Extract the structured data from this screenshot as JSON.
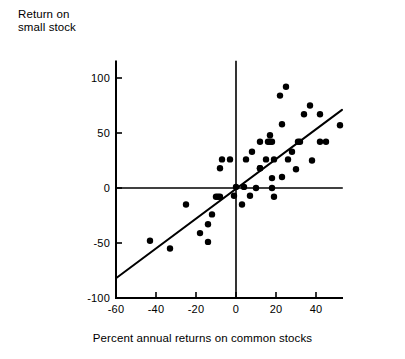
{
  "chart_data": {
    "type": "scatter",
    "title": "",
    "xlabel": "Percent annual returns on common stocks",
    "ylabel": "Return on small stock",
    "ylabel_lines": [
      "Return on",
      "small stock"
    ],
    "xlim": [
      -60,
      53
    ],
    "ylim": [
      -100,
      115
    ],
    "xticks": [
      -60,
      -40,
      -20,
      0,
      20,
      40
    ],
    "xtick_labels": [
      "-60",
      "-40",
      "-20",
      "0",
      "20",
      "40"
    ],
    "yticks": [
      -100,
      -50,
      0,
      50,
      100
    ],
    "ytick_labels": [
      "-100",
      "-50",
      "0",
      "50",
      "100"
    ],
    "grid": false,
    "legend": null,
    "axis_style": "crossed-zero-axes",
    "marker": "filled-circle",
    "marker_color": "#000000",
    "marker_radius": 3.2,
    "points": [
      {
        "x": -43,
        "y": -48
      },
      {
        "x": -33,
        "y": -55
      },
      {
        "x": -25,
        "y": -15
      },
      {
        "x": -18,
        "y": -41
      },
      {
        "x": -14,
        "y": -33
      },
      {
        "x": -14,
        "y": -49
      },
      {
        "x": -12,
        "y": -24
      },
      {
        "x": -10,
        "y": -8
      },
      {
        "x": -9,
        "y": -8
      },
      {
        "x": -8,
        "y": -8
      },
      {
        "x": -7,
        "y": 26
      },
      {
        "x": -8,
        "y": 18
      },
      {
        "x": -3,
        "y": 26
      },
      {
        "x": -1,
        "y": -7
      },
      {
        "x": 0,
        "y": 1
      },
      {
        "x": 3,
        "y": -15
      },
      {
        "x": 4,
        "y": 1
      },
      {
        "x": 5,
        "y": 26
      },
      {
        "x": 7,
        "y": -7
      },
      {
        "x": 8,
        "y": 33
      },
      {
        "x": 10,
        "y": 0
      },
      {
        "x": 12,
        "y": 42
      },
      {
        "x": 12,
        "y": 18
      },
      {
        "x": 12,
        "y": 18
      },
      {
        "x": 15,
        "y": 26
      },
      {
        "x": 16,
        "y": 42
      },
      {
        "x": 17,
        "y": 42
      },
      {
        "x": 18,
        "y": 42
      },
      {
        "x": 17,
        "y": 48
      },
      {
        "x": 18,
        "y": 9
      },
      {
        "x": 18,
        "y": 0
      },
      {
        "x": 19,
        "y": 26
      },
      {
        "x": 19,
        "y": -8
      },
      {
        "x": 22,
        "y": 84
      },
      {
        "x": 23,
        "y": 58
      },
      {
        "x": 23,
        "y": 10
      },
      {
        "x": 25,
        "y": 92
      },
      {
        "x": 26,
        "y": 26
      },
      {
        "x": 28,
        "y": 33
      },
      {
        "x": 30,
        "y": 17
      },
      {
        "x": 31,
        "y": 42
      },
      {
        "x": 32,
        "y": 42
      },
      {
        "x": 34,
        "y": 67
      },
      {
        "x": 37,
        "y": 75
      },
      {
        "x": 38,
        "y": 25
      },
      {
        "x": 42,
        "y": 67
      },
      {
        "x": 42,
        "y": 42
      },
      {
        "x": 45,
        "y": 42
      },
      {
        "x": 52,
        "y": 57
      }
    ],
    "fit_line": {
      "type": "linear-regression",
      "x_start": -60,
      "y_start": -82,
      "x_end": 53,
      "y_end": 71
    }
  }
}
